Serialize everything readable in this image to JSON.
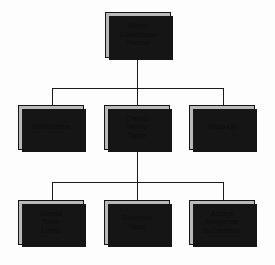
{
  "diagram": {
    "type": "structure-chart",
    "colors": {
      "box_fill": "#b9b9b9",
      "box_border": "#141414",
      "shadow": "#151515",
      "line": "#1b1b1b",
      "text": "#0d0d0d",
      "background": "#fdfdfd"
    },
    "nodes": [
      {
        "id": "metric-conversion-report",
        "label": "Metric\nConversion\nReport",
        "level": 0,
        "x": 105,
        "y": 12,
        "w": 66,
        "h": 46
      },
      {
        "id": "initialization",
        "label": "Initialization",
        "level": 1,
        "x": 18,
        "y": 105,
        "w": 66,
        "h": 45
      },
      {
        "id": "create-metric-table",
        "label": "Create\nMetric\nTable",
        "level": 1,
        "x": 104,
        "y": 105,
        "w": 66,
        "h": 45
      },
      {
        "id": "wrap-up",
        "label": "Wrap-Up",
        "level": 1,
        "x": 189,
        "y": 105,
        "w": 66,
        "h": 45
      },
      {
        "id": "accept-table-limits",
        "label": "Accept\nTable\nLimits",
        "level": 2,
        "x": 18,
        "y": 200,
        "w": 66,
        "h": 45
      },
      {
        "id": "generate-table",
        "label": "Generate\nTable",
        "level": 2,
        "x": 104,
        "y": 200,
        "w": 66,
        "h": 45
      },
      {
        "id": "accept-response-to-continue",
        "label": "Accept\nResponse\nto  Continue",
        "level": 2,
        "x": 189,
        "y": 200,
        "w": 66,
        "h": 45
      }
    ],
    "edges": [
      {
        "from": "metric-conversion-report",
        "to": "initialization"
      },
      {
        "from": "metric-conversion-report",
        "to": "create-metric-table"
      },
      {
        "from": "metric-conversion-report",
        "to": "wrap-up"
      },
      {
        "from": "create-metric-table",
        "to": "accept-table-limits"
      },
      {
        "from": "create-metric-table",
        "to": "generate-table"
      },
      {
        "from": "create-metric-table",
        "to": "accept-response-to-continue"
      }
    ]
  }
}
